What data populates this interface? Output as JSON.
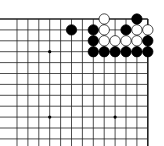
{
  "board": {
    "cols": 13,
    "rows": 12,
    "origin_x": 17,
    "origin_y": 19,
    "spacing": 10.9,
    "line_color": "#222222",
    "edges": [
      "top",
      "right"
    ],
    "star_points": [
      [
        3,
        3
      ],
      [
        3,
        9
      ],
      [
        9,
        9
      ]
    ],
    "stones": [
      {
        "col": 8,
        "row": 0,
        "color": "white"
      },
      {
        "col": 11,
        "row": 0,
        "color": "black"
      },
      {
        "col": 5,
        "row": 1,
        "color": "black"
      },
      {
        "col": 7,
        "row": 1,
        "color": "black"
      },
      {
        "col": 8,
        "row": 1,
        "color": "white"
      },
      {
        "col": 10,
        "row": 1,
        "color": "black"
      },
      {
        "col": 11,
        "row": 1,
        "color": "white"
      },
      {
        "col": 12,
        "row": 1,
        "color": "white"
      },
      {
        "col": 7,
        "row": 2,
        "color": "black"
      },
      {
        "col": 8,
        "row": 2,
        "color": "white"
      },
      {
        "col": 9,
        "row": 2,
        "color": "white"
      },
      {
        "col": 10,
        "row": 2,
        "color": "white"
      },
      {
        "col": 11,
        "row": 2,
        "color": "white"
      },
      {
        "col": 12,
        "row": 2,
        "color": "black"
      },
      {
        "col": 7,
        "row": 3,
        "color": "black"
      },
      {
        "col": 8,
        "row": 3,
        "color": "black"
      },
      {
        "col": 9,
        "row": 3,
        "color": "black"
      },
      {
        "col": 10,
        "row": 3,
        "color": "black"
      },
      {
        "col": 11,
        "row": 3,
        "color": "black"
      },
      {
        "col": 12,
        "row": 3,
        "color": "black"
      }
    ]
  }
}
